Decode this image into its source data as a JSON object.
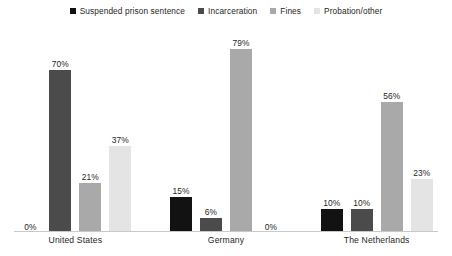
{
  "chart_data": {
    "type": "bar",
    "title": "",
    "subtitle": "",
    "xlabel": "",
    "ylabel": "",
    "ylim": [
      0,
      85
    ],
    "grid": false,
    "legend_position": "top-center",
    "value_label_suffix": "%",
    "categories": [
      "United States",
      "Germany",
      "The Netherlands"
    ],
    "series": [
      {
        "name": "Suspended prison sentence",
        "color": "#121212",
        "values": [
          0,
          15,
          10
        ],
        "labels": [
          "0%",
          "15%",
          "10%"
        ]
      },
      {
        "name": "Incarceration",
        "color": "#4b4b4b",
        "values": [
          70,
          6,
          10
        ],
        "labels": [
          "70%",
          "6%",
          "10%"
        ]
      },
      {
        "name": "Fines",
        "color": "#a9a9a9",
        "values": [
          21,
          79,
          56
        ],
        "labels": [
          "21%",
          "79%",
          "56%"
        ]
      },
      {
        "name": "Probation/other",
        "color": "#e4e4e4",
        "values": [
          37,
          0,
          23
        ],
        "labels": [
          "37%",
          "0%",
          "23%"
        ]
      }
    ]
  },
  "legend": {
    "items": [
      {
        "label": "Suspended prison sentence",
        "color": "#121212"
      },
      {
        "label": "Incarceration",
        "color": "#4b4b4b"
      },
      {
        "label": "Fines",
        "color": "#a9a9a9"
      },
      {
        "label": "Probation/other",
        "color": "#e4e4e4"
      }
    ]
  },
  "axis": {
    "baseline_color": "#c9c9c9"
  },
  "groups": [
    {
      "label": "United States",
      "bars": [
        {
          "series": "Suspended prison sentence",
          "value": 0,
          "label": "0%",
          "color": "#121212"
        },
        {
          "series": "Incarceration",
          "value": 70,
          "label": "70%",
          "color": "#4b4b4b"
        },
        {
          "series": "Fines",
          "value": 21,
          "label": "21%",
          "color": "#a9a9a9"
        },
        {
          "series": "Probation/other",
          "value": 37,
          "label": "37%",
          "color": "#e4e4e4"
        }
      ]
    },
    {
      "label": "Germany",
      "bars": [
        {
          "series": "Suspended prison sentence",
          "value": 15,
          "label": "15%",
          "color": "#121212"
        },
        {
          "series": "Incarceration",
          "value": 6,
          "label": "6%",
          "color": "#4b4b4b"
        },
        {
          "series": "Fines",
          "value": 79,
          "label": "79%",
          "color": "#a9a9a9"
        },
        {
          "series": "Probation/other",
          "value": 0,
          "label": "0%",
          "color": "#e4e4e4"
        }
      ]
    },
    {
      "label": "The Netherlands",
      "bars": [
        {
          "series": "Suspended prison sentence",
          "value": 10,
          "label": "10%",
          "color": "#121212"
        },
        {
          "series": "Incarceration",
          "value": 10,
          "label": "10%",
          "color": "#4b4b4b"
        },
        {
          "series": "Fines",
          "value": 56,
          "label": "56%",
          "color": "#a9a9a9"
        },
        {
          "series": "Probation/other",
          "value": 23,
          "label": "23%",
          "color": "#e4e4e4"
        }
      ]
    }
  ]
}
